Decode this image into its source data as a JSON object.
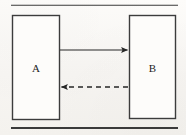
{
  "figure": {
    "background_color": "#fbfaf8",
    "ink_color": "#2b2b2b",
    "rule_color": "#3a3a3a",
    "caption_rule_top": "horizontal-rule-top",
    "caption_rule_bottom": "horizontal-rule-bottom"
  },
  "blocks": [
    {
      "id": "block-a",
      "label": "A",
      "x": 12,
      "y": 15,
      "width": 48,
      "height": 105,
      "stroke": "#3c3c3c",
      "fill": "#fdfcfa"
    },
    {
      "id": "block-b",
      "label": "B",
      "x": 129,
      "y": 15,
      "width": 47,
      "height": 104,
      "stroke": "#3c3c3c",
      "fill": "#fdfcfa"
    }
  ],
  "connectors": [
    {
      "id": "connector-forward",
      "style": "solid",
      "direction": "right",
      "from": "A",
      "to": "B",
      "x1": 60,
      "x2": 128,
      "y": 50,
      "stroke": "#262626"
    },
    {
      "id": "connector-feedback",
      "style": "dashed",
      "direction": "left",
      "from": "B",
      "to": "A",
      "x1": 128,
      "x2": 61,
      "y": 87,
      "stroke": "#262626",
      "dash_pattern": "5 4"
    }
  ],
  "rules": [
    {
      "id": "rule-top",
      "x1": 11,
      "x2": 178,
      "y": 5,
      "thickness": 1.1
    },
    {
      "id": "rule-bottom",
      "x1": 11,
      "x2": 178,
      "y": 128,
      "thickness": 1.7
    }
  ]
}
